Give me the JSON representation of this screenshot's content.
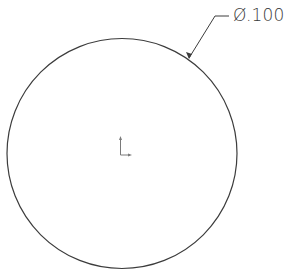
{
  "drawing": {
    "view": "front",
    "circle": {
      "center_x": 122,
      "center_y": 153,
      "radius": 115,
      "stroke_color": "#3c3c3c"
    },
    "dimension": {
      "type": "diameter",
      "symbol": "Ø",
      "value": ".100",
      "label": "Ø.100",
      "leader_color": "#3c3c3c"
    },
    "origin_marker": {
      "icon": "origin-axis-icon",
      "x": 122,
      "y": 153
    }
  }
}
